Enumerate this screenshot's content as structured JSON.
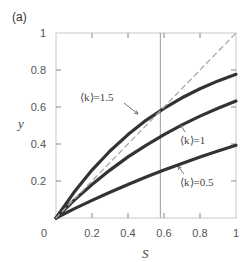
{
  "panel_label": "(a)",
  "chart_data": {
    "type": "line",
    "title": "",
    "panel": "(a)",
    "xlabel": "S",
    "ylabel": "y",
    "xlim": [
      0,
      1
    ],
    "ylim": [
      0,
      1
    ],
    "grid": false,
    "legend": "none (inline annotations)",
    "x_ticks": [
      0,
      0.2,
      0.4,
      0.6,
      0.8,
      1
    ],
    "x_tick_labels": [
      "0",
      "0.2",
      "0.4",
      "0.6",
      "0.8",
      "1"
    ],
    "y_ticks": [
      0.2,
      0.4,
      0.6,
      0.8,
      1
    ],
    "y_tick_labels": [
      "0.2",
      "0.4",
      "0.6",
      "0.8",
      "1"
    ],
    "x": [
      0,
      0.1,
      0.2,
      0.3,
      0.4,
      0.5,
      0.6,
      0.7,
      0.8,
      0.9,
      1.0
    ],
    "series": [
      {
        "name": "⟨k⟩=1.5",
        "style": "solid-thick",
        "color": "#333333",
        "values": [
          0,
          0.139,
          0.259,
          0.362,
          0.451,
          0.528,
          0.593,
          0.65,
          0.699,
          0.741,
          0.777
        ]
      },
      {
        "name": "⟨k⟩=1",
        "style": "solid-thick",
        "color": "#333333",
        "values": [
          0,
          0.095,
          0.181,
          0.259,
          0.33,
          0.393,
          0.451,
          0.503,
          0.551,
          0.593,
          0.632
        ]
      },
      {
        "name": "⟨k⟩=0.5",
        "style": "solid-thick",
        "color": "#333333",
        "values": [
          0,
          0.049,
          0.095,
          0.139,
          0.181,
          0.221,
          0.259,
          0.295,
          0.33,
          0.362,
          0.393
        ]
      },
      {
        "name": "y = S (diagonal)",
        "style": "dashed",
        "color": "#aaaaaa",
        "values": [
          0,
          0.1,
          0.2,
          0.3,
          0.4,
          0.5,
          0.6,
          0.7,
          0.8,
          0.9,
          1.0
        ]
      }
    ],
    "vertical_line": {
      "x": 0.58,
      "color": "#aaaaaa"
    },
    "annotations": [
      {
        "text": "⟨k⟩=1.5",
        "arrow_to": [
          0.53,
          0.56
        ]
      },
      {
        "text": "⟨k⟩=1",
        "arrow_to": [
          0.71,
          0.52
        ]
      },
      {
        "text": "⟨k⟩=0.5",
        "arrow_to": [
          0.64,
          0.27
        ]
      }
    ]
  }
}
